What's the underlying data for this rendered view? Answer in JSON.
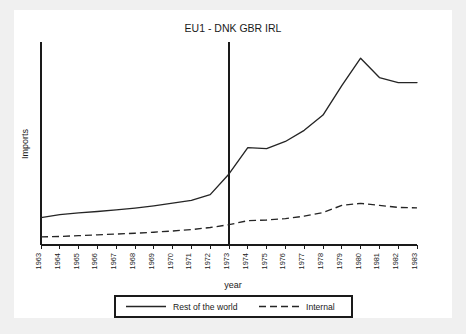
{
  "chart_data": {
    "type": "line",
    "title": "EU1 - DNK GBR IRL",
    "xlabel": "year",
    "ylabel": "Imports",
    "grid": false,
    "legend_position": "bottom",
    "x": [
      1963,
      1964,
      1965,
      1966,
      1967,
      1968,
      1969,
      1970,
      1971,
      1972,
      1973,
      1974,
      1975,
      1976,
      1977,
      1978,
      1979,
      1980,
      1981,
      1982,
      1983
    ],
    "categories": [
      "1963",
      "1964",
      "1965",
      "1966",
      "1967",
      "1968",
      "1969",
      "1970",
      "1971",
      "1972",
      "1973",
      "1974",
      "1975",
      "1976",
      "1977",
      "1978",
      "1979",
      "1980",
      "1981",
      "1982",
      "1983"
    ],
    "xlim": [
      1963,
      1983
    ],
    "ylim": [
      0,
      100
    ],
    "y_ticks_shown": false,
    "annotations": [
      {
        "type": "vertical-line",
        "x": 1973,
        "label": "accession-year-marker"
      }
    ],
    "series": [
      {
        "name": "Rest of the world",
        "style": "solid",
        "values": [
          13.5,
          15.0,
          15.8,
          16.5,
          17.3,
          18.2,
          19.3,
          20.6,
          22.0,
          24.8,
          35.0,
          48.0,
          47.5,
          51.0,
          56.5,
          64.0,
          78.5,
          92.0,
          82.5,
          80.0,
          80.0
        ]
      },
      {
        "name": "Internal",
        "style": "dashed",
        "values": [
          4.0,
          4.2,
          4.6,
          5.0,
          5.4,
          5.8,
          6.3,
          6.9,
          7.6,
          8.6,
          10.0,
          12.0,
          12.3,
          13.0,
          14.2,
          16.0,
          19.5,
          20.5,
          19.5,
          18.5,
          18.3
        ]
      }
    ]
  },
  "legend": {
    "entries": [
      {
        "label": "Rest of the world",
        "style": "solid"
      },
      {
        "label": "Internal",
        "style": "dashed"
      }
    ]
  }
}
